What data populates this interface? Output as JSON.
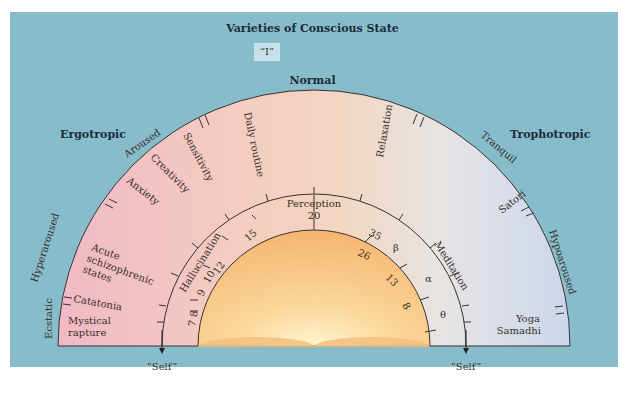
{
  "title": "Varieties of Conscious State",
  "top_box": "“I”",
  "top_label": "Normal",
  "side_labels": {
    "left": "Ergotropic",
    "right": "Trophotropic"
  },
  "outer_ring_labels": {
    "left_outside": [
      "Aroused",
      "Hyperaroused",
      "Ecstatic"
    ],
    "right_outside": [
      "Tranquil",
      "Hypoaroused"
    ],
    "inside": [
      "Sensitivity",
      "Creativity",
      "Anxiety",
      "Acute schizophrenic states",
      "Catatonia",
      "Mystical rapture",
      "Daily routine",
      "Relaxation",
      "Satori",
      "Yoga Samadhi"
    ]
  },
  "inner_scale": {
    "arc_labels": [
      "Hallucination",
      "Perception",
      "Meditation"
    ],
    "outer_numbers": [
      "7 8",
      "9",
      "10",
      "12",
      "15",
      "20",
      "35"
    ],
    "inner_numbers": [
      "26",
      "13",
      "8"
    ],
    "greek": [
      "β",
      "α",
      "θ"
    ]
  },
  "self_labels": {
    "left": "“Self”",
    "right": "“Self”"
  },
  "colors": {
    "background": "#87bccb",
    "left_ring": "#f1c2cc",
    "top_ring": "#f5d3bf",
    "right_ring": "#dde3ee",
    "dome": "#f7c27e",
    "text_dark": "#1d2b3a"
  }
}
